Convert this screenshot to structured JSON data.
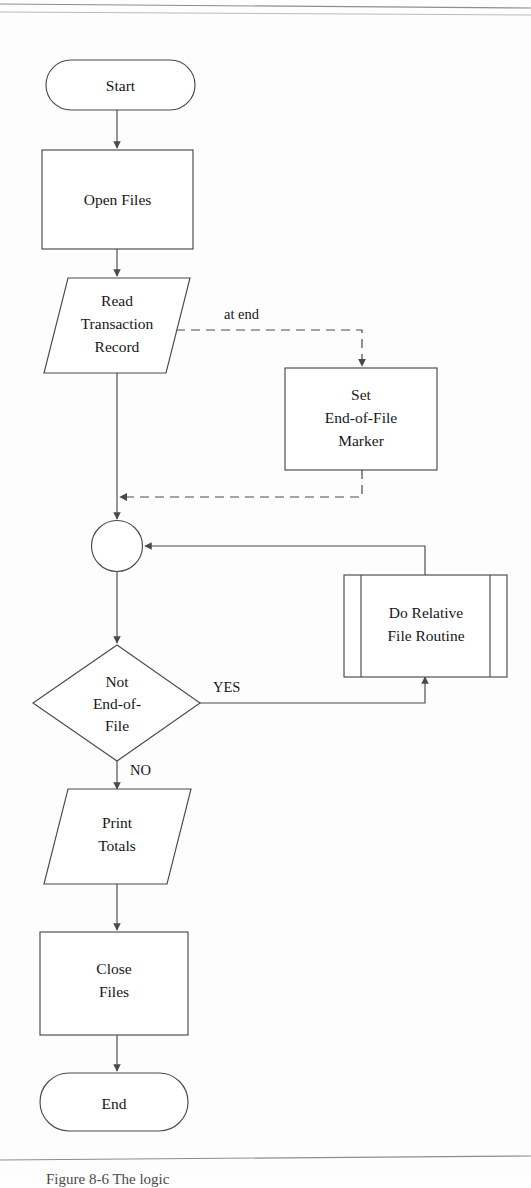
{
  "figure": {
    "caption": "Figure 8-6   The logic"
  },
  "diagram": {
    "type": "flowchart",
    "colors": {
      "stroke": "#4a4a4a",
      "text": "#161616",
      "background": "#ffffff",
      "rule": "#8d8d8d"
    },
    "nodes": [
      {
        "id": "start",
        "shape": "terminator",
        "label": "Start",
        "lines": [
          "Start"
        ]
      },
      {
        "id": "open_files",
        "shape": "process",
        "label": "Open Files",
        "lines": [
          "Open Files"
        ]
      },
      {
        "id": "read_transaction",
        "shape": "input-output",
        "label": "Read Transaction Record",
        "lines": [
          "Read",
          "Transaction",
          "Record"
        ]
      },
      {
        "id": "set_eof",
        "shape": "process",
        "label": "Set End-of-File Marker",
        "lines": [
          "Set",
          "End-of-File",
          "Marker"
        ]
      },
      {
        "id": "connector",
        "shape": "connector",
        "label": "",
        "lines": []
      },
      {
        "id": "do_relative",
        "shape": "predefined-process",
        "label": "Do Relative File Routine",
        "lines": [
          "Do Relative",
          "File Routine"
        ]
      },
      {
        "id": "not_eof",
        "shape": "decision",
        "label": "Not End-of-File",
        "lines": [
          "Not",
          "End-of-",
          "File"
        ]
      },
      {
        "id": "print_totals",
        "shape": "input-output",
        "label": "Print Totals",
        "lines": [
          "Print",
          "Totals"
        ]
      },
      {
        "id": "close_files",
        "shape": "process",
        "label": "Close Files",
        "lines": [
          "Close",
          "Files"
        ]
      },
      {
        "id": "end",
        "shape": "terminator",
        "label": "End",
        "lines": [
          "End"
        ]
      }
    ],
    "edges": [
      {
        "id": "e1",
        "from": "start",
        "to": "open_files",
        "label": "",
        "style": "solid"
      },
      {
        "id": "e2",
        "from": "open_files",
        "to": "read_transaction",
        "label": "",
        "style": "solid"
      },
      {
        "id": "e3",
        "from": "read_transaction",
        "to": "set_eof",
        "label": "at end",
        "style": "dashed"
      },
      {
        "id": "e4",
        "from": "set_eof",
        "to": "connector",
        "label": "",
        "style": "dashed"
      },
      {
        "id": "e5",
        "from": "read_transaction",
        "to": "connector",
        "label": "",
        "style": "solid"
      },
      {
        "id": "e6",
        "from": "connector",
        "to": "not_eof",
        "label": "",
        "style": "solid"
      },
      {
        "id": "e7",
        "from": "not_eof",
        "to": "do_relative",
        "label": "YES",
        "style": "solid"
      },
      {
        "id": "e8",
        "from": "do_relative",
        "to": "connector",
        "label": "",
        "style": "solid"
      },
      {
        "id": "e9",
        "from": "not_eof",
        "to": "print_totals",
        "label": "NO",
        "style": "solid"
      },
      {
        "id": "e10",
        "from": "print_totals",
        "to": "close_files",
        "label": "",
        "style": "solid"
      },
      {
        "id": "e11",
        "from": "close_files",
        "to": "end",
        "label": "",
        "style": "solid"
      }
    ],
    "labels": {
      "at_end": "at end",
      "yes": "YES",
      "no": "NO"
    }
  }
}
